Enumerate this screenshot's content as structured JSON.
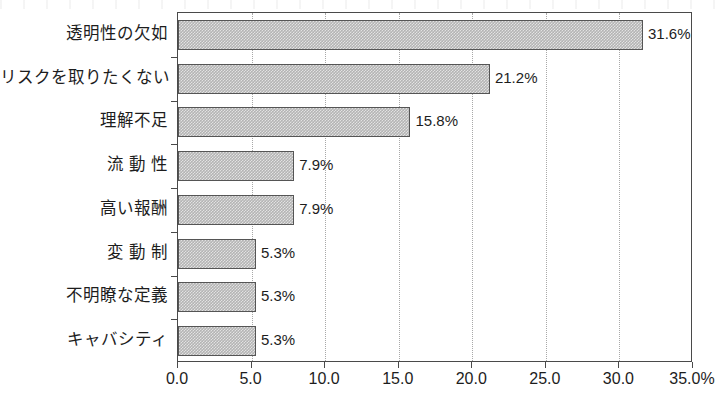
{
  "chart_data": {
    "type": "bar",
    "orientation": "horizontal",
    "title": "",
    "subtitle": "",
    "xlabel": "",
    "ylabel": "",
    "categories": [
      "透明性の欠如",
      "リスクを取りたくない",
      "理解不足",
      "流動性",
      "高い報酬",
      "変動制",
      "不明瞭な定義",
      "キャバシティ"
    ],
    "values": [
      31.6,
      21.2,
      15.8,
      7.9,
      7.9,
      5.3,
      5.3,
      5.3
    ],
    "data_labels": [
      "31.6%",
      "21.2%",
      "15.8%",
      "7.9%",
      "7.9%",
      "5.3%",
      "5.3%",
      "5.3%"
    ],
    "xlim": [
      0,
      35
    ],
    "xticks": [
      0,
      5,
      10,
      15,
      20,
      25,
      30,
      35
    ],
    "xticklabels": [
      "0.0",
      "5.0",
      "10.0",
      "15.0",
      "20.0",
      "25.0",
      "30.0",
      "35.0%"
    ],
    "grid": "vertical-dotted",
    "legend": "none",
    "units": "percent",
    "bar_color": "#b4b4b4",
    "bar_edge_color": "#555555",
    "gridline_color": "#a8a8a8",
    "axis_color": "#4a4a4a",
    "text_color": "#1d1d1d"
  }
}
